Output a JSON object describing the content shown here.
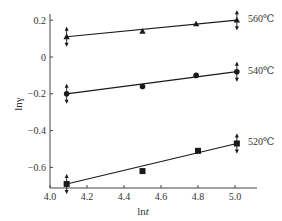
{
  "chart_data": {
    "type": "scatter",
    "title": "",
    "xlabel": "lnt",
    "xlabel_parts": {
      "prefix": "ln",
      "var": "t"
    },
    "ylabel": "lnγ",
    "xlim": [
      4.0,
      5.1
    ],
    "ylim": [
      -0.72,
      0.24
    ],
    "xticks": [
      4.0,
      4.2,
      4.4,
      4.6,
      4.8,
      5.0
    ],
    "xtick_labels": [
      "4.0",
      "4.2",
      "4.4",
      "4.6",
      "4.8",
      "5.0"
    ],
    "yticks": [
      0.2,
      0,
      -0.2,
      -0.4,
      -0.6
    ],
    "ytick_labels": [
      "0.2",
      "0",
      "−0.2",
      "−0.4",
      "−0.6"
    ],
    "grid": false,
    "legend": "inline labels at right end of each line",
    "series": [
      {
        "name": "560℃",
        "marker": "triangle",
        "x": [
          4.09,
          4.5,
          4.79,
          5.01
        ],
        "y": [
          0.11,
          0.14,
          0.18,
          0.2
        ],
        "fit": {
          "x": [
            4.09,
            5.01
          ],
          "y": [
            0.11,
            0.2
          ]
        },
        "error_bars_at": [
          4.09,
          5.01
        ]
      },
      {
        "name": "540℃",
        "marker": "circle",
        "x": [
          4.09,
          4.5,
          4.79,
          5.01
        ],
        "y": [
          -0.2,
          -0.16,
          -0.1,
          -0.08
        ],
        "fit": {
          "x": [
            4.09,
            5.01
          ],
          "y": [
            -0.2,
            -0.08
          ]
        },
        "error_bars_at": [
          4.09,
          5.01
        ]
      },
      {
        "name": "520℃",
        "marker": "square",
        "x": [
          4.09,
          4.5,
          4.8,
          5.01
        ],
        "y": [
          -0.69,
          -0.62,
          -0.51,
          -0.47
        ],
        "fit": {
          "x": [
            4.09,
            5.01
          ],
          "y": [
            -0.69,
            -0.47
          ]
        },
        "error_bars_at": [
          4.09,
          5.01
        ]
      }
    ]
  },
  "colors": {
    "line": "#1a1a1a",
    "axis": "#444444",
    "background": "#ffffff"
  }
}
